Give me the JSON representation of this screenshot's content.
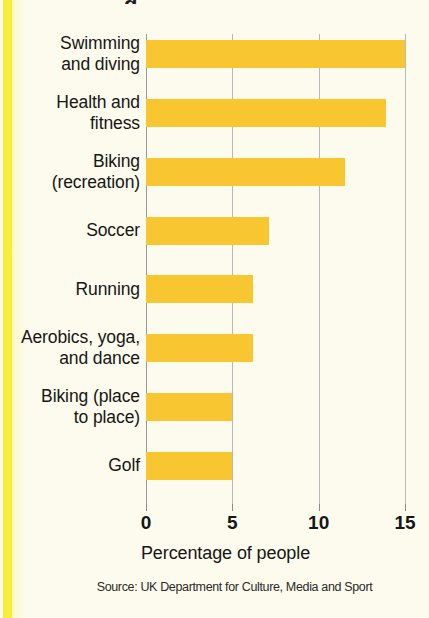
{
  "figure": {
    "background_color": "#fdfbed",
    "edge_strip_color": "#f7ee3c",
    "title_sliver": "g"
  },
  "chart_data": {
    "type": "bar",
    "orientation": "horizontal",
    "title": "",
    "xlabel": "Percentage of people",
    "ylabel": "",
    "xlim": [
      0,
      15.5
    ],
    "xticks": [
      0,
      5,
      10,
      15
    ],
    "xtick_labels": [
      "0",
      "5",
      "10",
      "15"
    ],
    "grid": "vertical gridlines at 0, 5, 10, 15",
    "legend": "none",
    "bar_color": "#f8c630",
    "categories": [
      "Swimming and diving",
      "Health and fitness",
      "Biking (recreation)",
      "Soccer",
      "Running",
      "Aerobics, yoga, and dance",
      "Biking (place to place)",
      "Golf"
    ],
    "category_label_lines": [
      [
        "Swimming",
        "and diving"
      ],
      [
        "Health and",
        "fitness"
      ],
      [
        "Biking",
        "(recreation)"
      ],
      [
        "Soccer"
      ],
      [
        "Running"
      ],
      [
        "Aerobics, yoga,",
        "and dance"
      ],
      [
        "Biking (place",
        "to place)"
      ],
      [
        "Golf"
      ]
    ],
    "values": [
      15.0,
      13.9,
      11.5,
      7.1,
      6.2,
      6.2,
      5.0,
      5.0
    ],
    "annotation": "Source: UK Department for Culture, Media and Sport"
  }
}
